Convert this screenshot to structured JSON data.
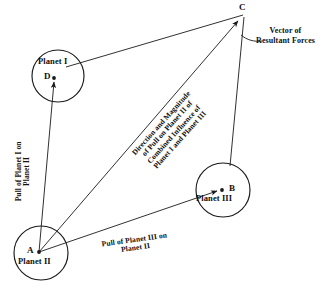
{
  "figure": {
    "type": "force-parallelogram-diagram",
    "stroke_color": "#1a1a1a",
    "text_color": "#111111",
    "background_color": "#ffffff"
  },
  "points": {
    "a": {
      "label": "A",
      "x": 39,
      "y": 252
    },
    "b": {
      "label": "B",
      "x": 222,
      "y": 190
    },
    "c": {
      "label": "C",
      "x": 243,
      "y": 14
    },
    "d": {
      "label": "D",
      "x": 54,
      "y": 78
    }
  },
  "planets": [
    {
      "name": "Planet I",
      "cx": 58,
      "cy": 76,
      "r": 26,
      "point": "D"
    },
    {
      "name": "Planet II",
      "cx": 41,
      "cy": 253,
      "r": 27,
      "point": "A"
    },
    {
      "name": "Planet III",
      "cx": 223,
      "cy": 190,
      "r": 27,
      "point": "B"
    }
  ],
  "force_labels": {
    "pull_of_planet_1": {
      "line1": "Pull of Planet I on",
      "line2": "Planet II"
    },
    "pull_of_planet_3": {
      "line1": "Pull of Planet III on",
      "line2": "Planet II"
    },
    "resultant": {
      "line1": "Direction and Magnitude",
      "line2": "of Pull on Planet II of",
      "line3": "Combined Influence of",
      "line4": "Planet I and Planet III"
    }
  },
  "annotations": {
    "vector_caption": {
      "line1": "Vector of",
      "line2": "Resultant Forces"
    }
  }
}
